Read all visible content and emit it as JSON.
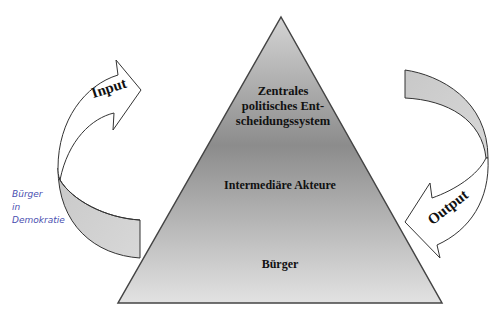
{
  "diagram": {
    "type": "pyramid-with-feedback-arrows",
    "pyramid": {
      "levels": [
        {
          "label": "Zentrales politisches Ent-scheidungssystem",
          "lines": [
            "Zentrales",
            "politisches Ent-",
            "scheidungssystem"
          ]
        },
        {
          "label": "Intermediäre Akteure"
        },
        {
          "label": "Bürger"
        }
      ],
      "gradient_top": "#c9c9c9",
      "gradient_mid": "#8f8f8f",
      "gradient_bottom": "#dcdcdc"
    },
    "arrows": {
      "input": {
        "label": "Input",
        "side": "left",
        "direction": "up"
      },
      "output": {
        "label": "Output",
        "side": "right",
        "direction": "down"
      }
    },
    "annotation": {
      "handwritten_lines": [
        "Bürger",
        "in",
        "Demokratie"
      ],
      "color": "#4a4fb0"
    }
  }
}
